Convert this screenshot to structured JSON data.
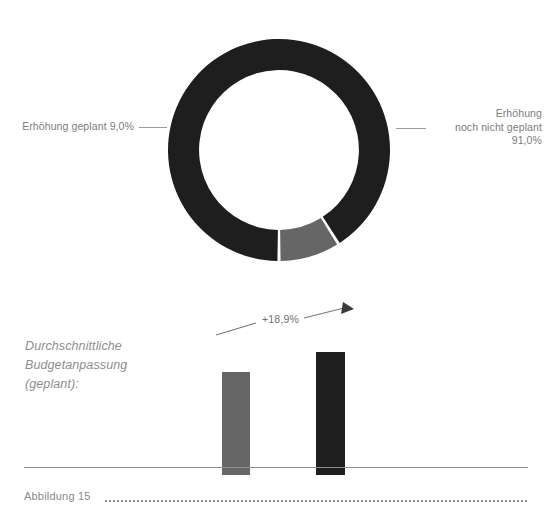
{
  "chart_data": [
    {
      "type": "pie",
      "title": "",
      "variant": "donut",
      "labels": [
        "Erhöhung geplant",
        "Erhöhung noch nicht geplant"
      ],
      "values": [
        9.0,
        91.0
      ],
      "value_labels": [
        "9,0%",
        "91,0%"
      ],
      "colors": [
        "#666666",
        "#1e1e1e"
      ],
      "start_angle_deg": 180,
      "direction": "counterclockwise",
      "inner_radius_ratio": 0.72,
      "legend": "outside-callout-labels",
      "annotations": [
        {
          "name": "left-callout",
          "text": "Erhöhung geplant 9,0%",
          "position": "left"
        },
        {
          "name": "right-callout",
          "text": "Erhöhung noch nicht geplant 91,0%",
          "position": "right"
        }
      ]
    },
    {
      "type": "bar",
      "title": "",
      "categories": [
        "aktuell",
        "geplant"
      ],
      "values": [
        100,
        118.9
      ],
      "colors": [
        "#666666",
        "#1e1e1e"
      ],
      "grid": false,
      "xlabel": "",
      "ylabel": "",
      "annotations": [
        {
          "name": "growth-arrow",
          "text": "+18,9%",
          "type": "arrow",
          "from": "bar-0",
          "to": "bar-1"
        }
      ],
      "side_label": "Durchschnittliche Budgetanpassung (geplant):"
    }
  ],
  "donut": {
    "label_left": {
      "lines": [
        "Erhöhung geplant 9,0%"
      ]
    },
    "label_right": {
      "line1": "Erhöhung",
      "line2": "noch nicht geplant",
      "line3": "91,0%"
    }
  },
  "bars": {
    "side_label": {
      "line1": "Durchschnittliche",
      "line2": "Budgetanpassung",
      "line3": "(geplant):"
    },
    "growth_label": "+18,9%"
  },
  "footer": {
    "caption": "Abbildung 15"
  },
  "colors": {
    "dark": "#1e1e1e",
    "gray": "#666666",
    "text": "#7c7c7c",
    "rule": "#8f8f8f"
  }
}
